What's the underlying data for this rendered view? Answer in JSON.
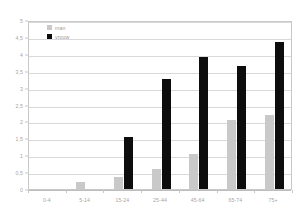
{
  "chart_data": {
    "type": "bar",
    "title": "",
    "subtitle": "",
    "xlabel": "",
    "ylabel": "",
    "categories": [
      "0-4",
      "5-14",
      "15-24",
      "25-44",
      "45-64",
      "65-74",
      "75+"
    ],
    "series": [
      {
        "name": "man",
        "color": "#c9c9c9",
        "values": [
          0,
          0.2,
          0.35,
          0.6,
          1.05,
          2.05,
          2.2
        ]
      },
      {
        "name": "vrouw",
        "color": "#0d0d0d",
        "values": [
          0,
          0,
          1.55,
          3.25,
          3.9,
          3.65,
          4.35
        ]
      }
    ],
    "ylim": [
      0,
      5
    ],
    "ytick_values": [
      0,
      0.5,
      1,
      1.5,
      2,
      2.5,
      3,
      3.5,
      4,
      4.5,
      5
    ],
    "ytick_labels": [
      "0",
      "0,5",
      "1",
      "1,5",
      "2",
      "2,5",
      "3",
      "3,5",
      "4",
      "4,5",
      "5"
    ],
    "grid": true,
    "grid_axis": "y",
    "legend_position": "top-left-inside",
    "legend_entries": [
      "man",
      "vrouw"
    ]
  },
  "axes": {
    "y_axis_name": "value-axis",
    "x_axis_name": "category-axis"
  }
}
